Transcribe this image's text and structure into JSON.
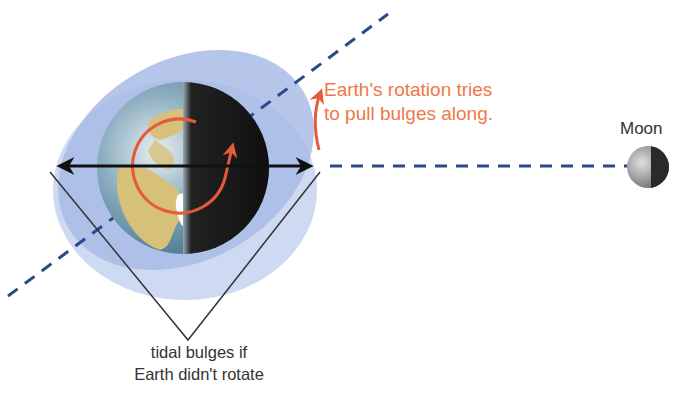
{
  "diagram": {
    "colors": {
      "annotation_orange": "#f0784a",
      "dashed_line_blue": "#2b4a8a",
      "bulge_outer": "#c5d3ef",
      "bulge_inner": "#9fb3e3",
      "ocean": "#5f8fa6",
      "land": "#d7c07a",
      "night": "#121212",
      "rotation_arrow": "#e45a3a",
      "text_dark": "#333333"
    },
    "labels": {
      "rotation_note_line1": "Earth's rotation tries",
      "rotation_note_line2": "to pull bulges along.",
      "moon": "Moon",
      "bulge_caption_line1": "tidal bulges if",
      "bulge_caption_line2": "Earth didn't rotate"
    },
    "elements": {
      "earth": "earth-globe",
      "moon": "moon-sphere",
      "bulge_rotated": "tilted-tidal-bulge-ellipse",
      "bulge_aligned": "horizontal-tidal-bulge-ellipse",
      "earth_moon_line": "dashed-line-to-moon",
      "bulge_axis_line": "dashed-tilted-bulge-axis",
      "double_arrow": "bulge-width-arrow",
      "rotation_arrow": "curved-rotation-arrow",
      "pull_arrow": "curved-pull-arrow"
    }
  }
}
